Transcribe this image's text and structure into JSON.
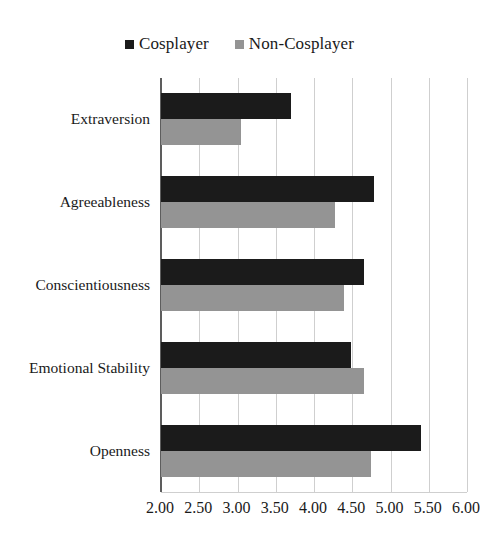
{
  "chart_data": {
    "type": "bar",
    "orientation": "horizontal",
    "title": "",
    "subtitle": "",
    "xlabel": "",
    "ylabel": "",
    "xlim": [
      2.0,
      6.0
    ],
    "xticks": [
      "2.00",
      "2.50",
      "3.00",
      "3.50",
      "4.00",
      "4.50",
      "5.00",
      "5.50",
      "6.00"
    ],
    "xtick_values": [
      2.0,
      2.5,
      3.0,
      3.5,
      4.0,
      4.5,
      5.0,
      5.5,
      6.0
    ],
    "grid": true,
    "grid_axis": "x",
    "legend_position": "top-center",
    "categories": [
      "Extraversion",
      "Agreeableness",
      "Conscientiousness",
      "Emotional Stability",
      "Openness"
    ],
    "series": [
      {
        "name": "Cosplayer",
        "color": "#1b1b1b",
        "values": [
          3.7,
          4.78,
          4.65,
          4.48,
          5.4
        ]
      },
      {
        "name": "Non-Cosplayer",
        "color": "#949494",
        "values": [
          3.05,
          4.28,
          4.39,
          4.65,
          4.74
        ]
      }
    ]
  },
  "legend": {
    "items": [
      {
        "label": "Cosplayer",
        "marker": "square-marker",
        "color": "#1b1b1b"
      },
      {
        "label": "Non-Cosplayer",
        "marker": "square-marker",
        "color": "#949494"
      }
    ]
  },
  "axis": {
    "line_color": "#5d5d5d",
    "gridline_color": "#cfcfcf"
  }
}
